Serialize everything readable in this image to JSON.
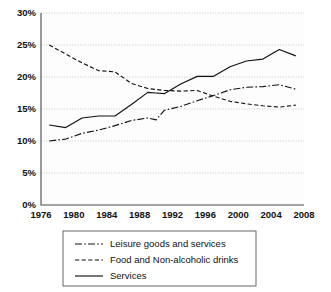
{
  "chart_data": {
    "type": "line",
    "title": "",
    "xlabel": "",
    "ylabel": "",
    "xlim": [
      1976,
      2008
    ],
    "ylim": [
      0,
      30
    ],
    "grid": true,
    "legend_position": "bottom",
    "x_ticks": [
      "1976",
      "1980",
      "1984",
      "1988",
      "1992",
      "1996",
      "2000",
      "2004",
      "2008"
    ],
    "y_ticks": [
      "0%",
      "5%",
      "10%",
      "15%",
      "20%",
      "25%",
      "30%"
    ],
    "y_tick_values": [
      0,
      5,
      10,
      15,
      20,
      25,
      30
    ],
    "x_tick_values": [
      1976,
      1980,
      1984,
      1988,
      1992,
      1996,
      2000,
      2004,
      2008
    ],
    "series": [
      {
        "name": "Leisure goods and services",
        "style": "dashdot",
        "dasharray": "7,2.2,1.6,2.2",
        "x": [
          1977,
          1979,
          1981,
          1983,
          1985,
          1987,
          1989,
          1990,
          1991,
          1993,
          1995,
          1997,
          1999,
          2001,
          2003,
          2005,
          2007
        ],
        "values": [
          10.0,
          10.3,
          11.2,
          11.7,
          12.4,
          13.2,
          13.6,
          13.3,
          14.8,
          15.4,
          16.3,
          17.1,
          18.0,
          18.4,
          18.5,
          18.8,
          18.1
        ]
      },
      {
        "name": "Food and Non-alcoholic drinks",
        "style": "dashed",
        "dasharray": "4.2,2.4",
        "x": [
          1977,
          1979,
          1981,
          1983,
          1985,
          1987,
          1989,
          1991,
          1993,
          1995,
          1997,
          1999,
          2001,
          2003,
          2005,
          2007
        ],
        "values": [
          25.0,
          23.6,
          22.2,
          21.0,
          20.8,
          19.0,
          18.2,
          17.9,
          17.8,
          17.9,
          17.0,
          16.2,
          15.8,
          15.5,
          15.3,
          15.6
        ]
      },
      {
        "name": "Services",
        "style": "solid",
        "dasharray": "",
        "x": [
          1977,
          1979,
          1981,
          1983,
          1985,
          1987,
          1989,
          1990,
          1991,
          1993,
          1995,
          1997,
          1999,
          2001,
          2003,
          2005,
          2007
        ],
        "values": [
          12.5,
          12.1,
          13.6,
          13.9,
          13.9,
          15.7,
          17.6,
          17.5,
          17.4,
          18.9,
          20.1,
          20.1,
          21.6,
          22.5,
          22.8,
          24.3,
          23.3
        ]
      }
    ]
  },
  "legend": {
    "items": [
      {
        "label": "Leisure goods and services"
      },
      {
        "label": "Food and Non-alcoholic drinks"
      },
      {
        "label": "Services"
      }
    ]
  }
}
